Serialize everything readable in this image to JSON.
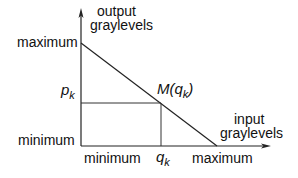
{
  "diagram": {
    "y_axis": {
      "label_line1": "output",
      "label_line2": "graylevels",
      "max_label": "maximum",
      "min_label": "minimum"
    },
    "x_axis": {
      "label_line1": "input",
      "label_line2": "graylevels",
      "min_label": "minimum",
      "max_label": "maximum"
    },
    "point": {
      "label_prefix": "M(q",
      "label_sub": "k",
      "label_suffix": ")",
      "p_main": "p",
      "p_sub": "k",
      "q_main": "q",
      "q_sub": "k"
    },
    "colors": {
      "line": "#222222",
      "guide": "#333333",
      "background": "#ffffff"
    }
  }
}
